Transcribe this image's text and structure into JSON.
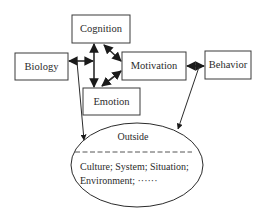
{
  "diagram": {
    "nodes": {
      "cognition": {
        "label": "Cognition"
      },
      "biology": {
        "label": "Biology"
      },
      "motivation": {
        "label": "Motivation"
      },
      "behavior": {
        "label": "Behavior"
      },
      "emotion": {
        "label": "Emotion"
      }
    },
    "outside": {
      "title": "Outside",
      "line1": "Culture; System; Situation;",
      "line2": "Environment; ······"
    },
    "edges": [
      {
        "from": "biology",
        "to": "cognition-emotion-connector",
        "type": "bidirectional"
      },
      {
        "from": "cognition",
        "to": "emotion",
        "type": "bidirectional"
      },
      {
        "from": "cognition",
        "to": "motivation",
        "type": "bidirectional"
      },
      {
        "from": "emotion",
        "to": "motivation",
        "type": "bidirectional"
      },
      {
        "from": "motivation",
        "to": "behavior",
        "type": "bidirectional"
      },
      {
        "from": "biology",
        "to": "outside",
        "type": "directed"
      },
      {
        "from": "behavior",
        "to": "outside",
        "type": "directed"
      }
    ],
    "colors": {
      "stroke": "#2b2b2b",
      "background": "#ffffff"
    }
  }
}
